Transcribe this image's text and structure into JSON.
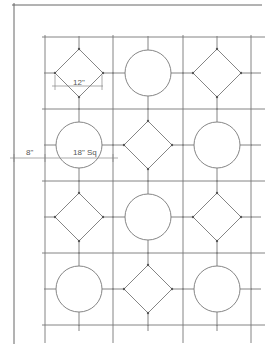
{
  "drawing": {
    "title": "Tile pattern layout",
    "line_color": "#666666",
    "grid": {
      "x_lines": [
        45,
        113,
        183,
        251
      ],
      "y_lines": [
        37,
        109,
        181,
        253,
        325
      ]
    },
    "shapes": [
      {
        "type": "diamond",
        "row": 0,
        "col": 0
      },
      {
        "type": "circle",
        "row": 0,
        "col": 1
      },
      {
        "type": "diamond",
        "row": 0,
        "col": 2
      },
      {
        "type": "circle",
        "row": 1,
        "col": 0
      },
      {
        "type": "diamond",
        "row": 1,
        "col": 1
      },
      {
        "type": "circle",
        "row": 1,
        "col": 2
      },
      {
        "type": "diamond",
        "row": 2,
        "col": 0
      },
      {
        "type": "circle",
        "row": 2,
        "col": 1
      },
      {
        "type": "diamond",
        "row": 2,
        "col": 2
      },
      {
        "type": "circle",
        "row": 3,
        "col": 0
      },
      {
        "type": "diamond",
        "row": 3,
        "col": 1
      },
      {
        "type": "circle",
        "row": 3,
        "col": 2
      }
    ],
    "dimensions": {
      "diamond_width": "12\"",
      "circle_size": "18\" Sq",
      "border_offset": "8\""
    }
  }
}
